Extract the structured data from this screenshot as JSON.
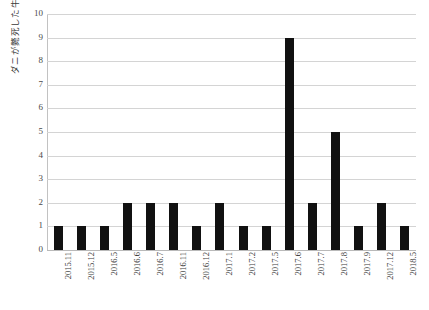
{
  "chart_data": {
    "type": "bar",
    "title": "",
    "xlabel": "",
    "ylabel": "ダニが斃死した牛群数",
    "categories": [
      "2015.11",
      "2015.12",
      "2016.5",
      "2016.6",
      "2016.7",
      "2016.11",
      "2016.12",
      "2017.1",
      "2017.2",
      "2017.5",
      "2017.6",
      "2017.7",
      "2017.8",
      "2017.9",
      "2017.12",
      "2018.5"
    ],
    "values": [
      1,
      1,
      1,
      2,
      2,
      2,
      1,
      2,
      1,
      1,
      9,
      2,
      5,
      1,
      2,
      1
    ],
    "ylim": [
      0,
      10
    ],
    "ytick_labels": [
      "0",
      "1",
      "2",
      "3",
      "4",
      "5",
      "6",
      "7",
      "8",
      "9",
      "10"
    ],
    "ytick_values": [
      0,
      1,
      2,
      3,
      4,
      5,
      6,
      7,
      8,
      9,
      10
    ],
    "grid": true,
    "legend": false,
    "bar_color": "#111111",
    "gridline_color": "#d4d4d4",
    "background_color": "#ffffff"
  }
}
